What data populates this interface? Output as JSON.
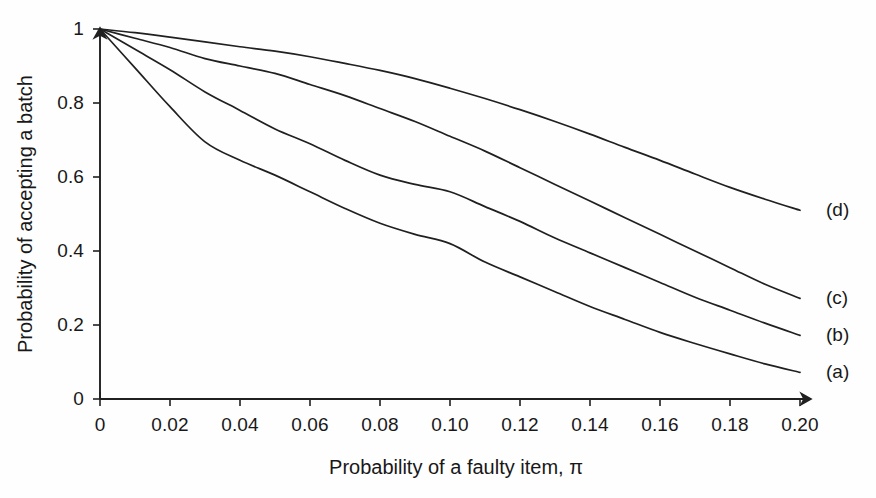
{
  "chart_data": {
    "type": "line",
    "title": "",
    "xlabel": "Probability of a faulty item, π",
    "ylabel": "Probability of accepting a batch",
    "xlim": [
      0,
      0.2
    ],
    "ylim": [
      0,
      1
    ],
    "grid": false,
    "legend_position": "right-of-curve-ends",
    "xticks": [
      0,
      0.02,
      0.04,
      0.06,
      0.08,
      0.1,
      0.12,
      0.14,
      0.16,
      0.18,
      0.2
    ],
    "xtick_labels": [
      "0",
      "0.02",
      "0.04",
      "0.06",
      "0.08",
      "0.10",
      "0.12",
      "0.14",
      "0.16",
      "0.18",
      "0.20"
    ],
    "yticks": [
      0,
      0.2,
      0.4,
      0.6,
      0.8,
      1
    ],
    "ytick_labels": [
      "0",
      "0.2",
      "0.4",
      "0.6",
      "0.8",
      "1"
    ],
    "axis_style": "arrow-terminated",
    "line_color": "#202020",
    "background_color": "#fefefe",
    "x": [
      0,
      0.01,
      0.02,
      0.03,
      0.04,
      0.05,
      0.06,
      0.07,
      0.08,
      0.09,
      0.1,
      0.11,
      0.12,
      0.13,
      0.14,
      0.15,
      0.16,
      0.17,
      0.18,
      0.19,
      0.2
    ],
    "series": [
      {
        "name": "(a)",
        "label": "(a)",
        "values": [
          1.0,
          0.895,
          0.79,
          0.695,
          0.645,
          0.605,
          0.56,
          0.515,
          0.475,
          0.445,
          0.42,
          0.37,
          0.33,
          0.29,
          0.25,
          0.215,
          0.18,
          0.15,
          0.122,
          0.095,
          0.072
        ]
      },
      {
        "name": "(b)",
        "label": "(b)",
        "values": [
          1.0,
          0.945,
          0.89,
          0.83,
          0.78,
          0.73,
          0.69,
          0.645,
          0.605,
          0.58,
          0.56,
          0.52,
          0.48,
          0.435,
          0.395,
          0.355,
          0.315,
          0.275,
          0.24,
          0.205,
          0.172
        ]
      },
      {
        "name": "(c)",
        "label": "(c)",
        "values": [
          1.0,
          0.975,
          0.95,
          0.92,
          0.9,
          0.88,
          0.85,
          0.82,
          0.785,
          0.75,
          0.71,
          0.67,
          0.625,
          0.58,
          0.535,
          0.49,
          0.445,
          0.4,
          0.355,
          0.31,
          0.272
        ]
      },
      {
        "name": "(d)",
        "label": "(d)",
        "values": [
          1.0,
          0.99,
          0.978,
          0.965,
          0.952,
          0.94,
          0.925,
          0.907,
          0.888,
          0.866,
          0.84,
          0.812,
          0.782,
          0.75,
          0.716,
          0.68,
          0.645,
          0.608,
          0.572,
          0.54,
          0.51
        ]
      }
    ],
    "curve_labels": [
      {
        "text": "(d)",
        "x_px": 826,
        "y_value": 0.51
      },
      {
        "text": "(c)",
        "x_px": 826,
        "y_value": 0.272
      },
      {
        "text": "(b)",
        "x_px": 826,
        "y_value": 0.172
      },
      {
        "text": "(a)",
        "x_px": 826,
        "y_value": 0.072
      }
    ]
  }
}
